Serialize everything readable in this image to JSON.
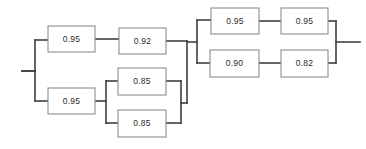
{
  "diagram": {
    "type": "reliability-block-diagram",
    "background_color": "#ffffff",
    "wire_color": "#3f3f3f",
    "block_border_color": "#8d8d8d",
    "block_fill_color": "#ffffff",
    "label_color": "#2b2b2b",
    "blocks": [
      {
        "id": "b1",
        "label": "0.95",
        "x": 48,
        "y": 26,
        "w": 47,
        "h": 26,
        "branch": "top-left-path"
      },
      {
        "id": "b2",
        "label": "0.92",
        "x": 119,
        "y": 28,
        "w": 47,
        "h": 26,
        "branch": "top-left-path"
      },
      {
        "id": "b3",
        "label": "0.95",
        "x": 48,
        "y": 88,
        "w": 47,
        "h": 26,
        "branch": "bottom-left-path"
      },
      {
        "id": "b4",
        "label": "0.85",
        "x": 118,
        "y": 68,
        "w": 48,
        "h": 27,
        "branch": "bottom-left-parallel-upper"
      },
      {
        "id": "b5",
        "label": "0.85",
        "x": 118,
        "y": 110,
        "w": 48,
        "h": 27,
        "branch": "bottom-left-parallel-lower"
      },
      {
        "id": "b6",
        "label": "0.95",
        "x": 211,
        "y": 8,
        "w": 48,
        "h": 26,
        "branch": "right-upper-path"
      },
      {
        "id": "b7",
        "label": "0.95",
        "x": 281,
        "y": 8,
        "w": 47,
        "h": 26,
        "branch": "right-upper-path"
      },
      {
        "id": "b8",
        "label": "0.90",
        "x": 210,
        "y": 50,
        "w": 49,
        "h": 27,
        "branch": "right-lower-path"
      },
      {
        "id": "b9",
        "label": "0.82",
        "x": 281,
        "y": 50,
        "w": 47,
        "h": 27,
        "branch": "right-lower-path"
      }
    ],
    "wires": [
      {
        "id": "w-input",
        "d": "M 22 71 L 35 71"
      },
      {
        "id": "w-left-split-bar",
        "d": "M 35 71 L 35 71"
      },
      {
        "id": "w-left-feed",
        "d": "M 22 71 L 35 71 L 35 71"
      },
      {
        "id": "w-left-bus-vert",
        "d": "M 35 40 L 35 101"
      },
      {
        "id": "w-left-bus-top",
        "d": "M 35 40 L 48 40"
      },
      {
        "id": "w-left-bus-bot",
        "d": "M 35 101 L 48 101"
      },
      {
        "id": "w-b1-b2",
        "d": "M 95 39 L 119 39"
      },
      {
        "id": "w-b2-out",
        "d": "M 166 41 L 187 41"
      },
      {
        "id": "w-b3-out",
        "d": "M 95 101 L 106 101"
      },
      {
        "id": "w-par-in-bar",
        "d": "M 106 81 L 106 123"
      },
      {
        "id": "w-par-in-top",
        "d": "M 106 81 L 118 81"
      },
      {
        "id": "w-par-in-bot",
        "d": "M 106 123 L 118 123"
      },
      {
        "id": "w-par-out-top",
        "d": "M 166 81 L 181 81"
      },
      {
        "id": "w-par-out-bot",
        "d": "M 166 123 L 181 123"
      },
      {
        "id": "w-par-out-bar",
        "d": "M 181 81 L 181 123"
      },
      {
        "id": "w-par-out-mid",
        "d": "M 181 103 L 187 103"
      },
      {
        "id": "w-mid-merge-bar",
        "d": "M 187 41 L 187 103"
      },
      {
        "id": "w-mid-to-right",
        "d": "M 187 42 L 197 42"
      },
      {
        "id": "w-right-in-bar",
        "d": "M 197 20 L 197 63"
      },
      {
        "id": "w-right-in-top",
        "d": "M 197 20 L 211 20"
      },
      {
        "id": "w-right-in-bot",
        "d": "M 197 63 L 210 63"
      },
      {
        "id": "w-b6-b7",
        "d": "M 259 21 L 281 21"
      },
      {
        "id": "w-b8-b9",
        "d": "M 259 63 L 281 63"
      },
      {
        "id": "w-right-out-top",
        "d": "M 328 21 L 336 21"
      },
      {
        "id": "w-right-out-bot",
        "d": "M 328 63 L 336 63"
      },
      {
        "id": "w-right-out-bar",
        "d": "M 336 21 L 336 63"
      },
      {
        "id": "w-output",
        "d": "M 336 42 L 360 42"
      }
    ]
  }
}
